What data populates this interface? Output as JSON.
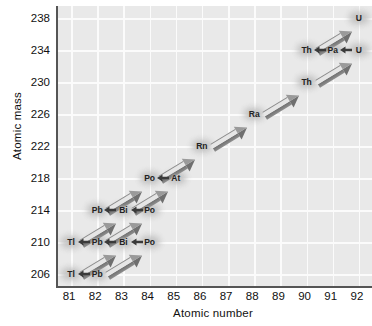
{
  "chart_data": {
    "type": "scatter",
    "title": "",
    "xlabel": "Atomic number",
    "ylabel": "Atomic mass",
    "xlim": [
      80.5,
      92.5
    ],
    "ylim": [
      204.5,
      239.5
    ],
    "xticks": [
      81,
      82,
      83,
      84,
      85,
      86,
      87,
      88,
      89,
      90,
      91,
      92
    ],
    "yticks": [
      206,
      210,
      214,
      218,
      222,
      226,
      230,
      234,
      238
    ],
    "grid": true,
    "legend": "none",
    "nodes": [
      {
        "label": "U",
        "x": 92,
        "y": 238
      },
      {
        "label": "Th",
        "x": 90,
        "y": 234
      },
      {
        "label": "Pa",
        "x": 91,
        "y": 234
      },
      {
        "label": "U",
        "x": 92,
        "y": 234
      },
      {
        "label": "Th",
        "x": 90,
        "y": 230
      },
      {
        "label": "Ra",
        "x": 88,
        "y": 226
      },
      {
        "label": "Rn",
        "x": 86,
        "y": 222
      },
      {
        "label": "Po",
        "x": 84,
        "y": 218
      },
      {
        "label": "At",
        "x": 85,
        "y": 218
      },
      {
        "label": "Pb",
        "x": 82,
        "y": 214
      },
      {
        "label": "Bi",
        "x": 83,
        "y": 214
      },
      {
        "label": "Po",
        "x": 84,
        "y": 214
      },
      {
        "label": "Tl",
        "x": 81,
        "y": 210
      },
      {
        "label": "Pb",
        "x": 82,
        "y": 210
      },
      {
        "label": "Bi",
        "x": 83,
        "y": 210
      },
      {
        "label": "Po",
        "x": 84,
        "y": 210
      },
      {
        "label": "Tl",
        "x": 81,
        "y": 206
      },
      {
        "label": "Pb",
        "x": 82,
        "y": 206
      }
    ],
    "alpha_decays": [
      {
        "from": [
          92,
          238
        ],
        "to": [
          90,
          234
        ]
      },
      {
        "from": [
          92,
          234
        ],
        "to": [
          90,
          230
        ]
      },
      {
        "from": [
          90,
          230
        ],
        "to": [
          88,
          226
        ]
      },
      {
        "from": [
          88,
          226
        ],
        "to": [
          86,
          222
        ]
      },
      {
        "from": [
          86,
          222
        ],
        "to": [
          84,
          218
        ]
      },
      {
        "from": [
          85,
          218
        ],
        "to": [
          83,
          214
        ]
      },
      {
        "from": [
          84,
          218
        ],
        "to": [
          82,
          214
        ]
      },
      {
        "from": [
          84,
          214
        ],
        "to": [
          82,
          210
        ]
      },
      {
        "from": [
          83,
          214
        ],
        "to": [
          81,
          210
        ]
      },
      {
        "from": [
          84,
          210
        ],
        "to": [
          82,
          206
        ]
      },
      {
        "from": [
          83,
          210
        ],
        "to": [
          81,
          206
        ]
      }
    ],
    "beta_decays": [
      {
        "from": [
          92,
          234
        ],
        "to": [
          91,
          234
        ]
      },
      {
        "from": [
          91,
          234
        ],
        "to": [
          90,
          234
        ]
      },
      {
        "from": [
          85,
          218
        ],
        "to": [
          84,
          218
        ]
      },
      {
        "from": [
          84,
          214
        ],
        "to": [
          83,
          214
        ]
      },
      {
        "from": [
          83,
          214
        ],
        "to": [
          82,
          214
        ]
      },
      {
        "from": [
          84,
          210
        ],
        "to": [
          83,
          210
        ]
      },
      {
        "from": [
          83,
          210
        ],
        "to": [
          82,
          210
        ]
      },
      {
        "from": [
          82,
          210
        ],
        "to": [
          81,
          210
        ]
      },
      {
        "from": [
          82,
          206
        ],
        "to": [
          81,
          206
        ]
      }
    ]
  },
  "axes": {
    "xlabel": "Atomic number",
    "ylabel": "Atomic mass"
  },
  "colors": {
    "plot_background": "#e9e9e9",
    "gridline": "#fbfbfb",
    "axis_line": "#555555",
    "node_halo": "#c2c2c2",
    "arrow_dark": "#6f6f6f",
    "arrow_light": "#e6e6e6",
    "text": "#1a1a1a"
  }
}
